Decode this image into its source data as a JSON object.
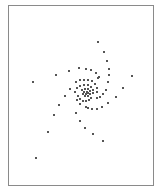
{
  "chart_data": {
    "type": "scatter",
    "title": "",
    "xlabel": "",
    "ylabel": "",
    "grid": false,
    "legend": null,
    "frame": {
      "x": 8,
      "y": 5,
      "width": 145,
      "height": 180,
      "color": "#8a8a8a"
    },
    "marker_color": "#555555",
    "points_px": [
      [
        98,
        42
      ],
      [
        104,
        52
      ],
      [
        107,
        61
      ],
      [
        109,
        69
      ],
      [
        109,
        75
      ],
      [
        108,
        82
      ],
      [
        106,
        90
      ],
      [
        103,
        94
      ],
      [
        100,
        97
      ],
      [
        97,
        98
      ],
      [
        132,
        76
      ],
      [
        123,
        88
      ],
      [
        116,
        97
      ],
      [
        108,
        103
      ],
      [
        102,
        107
      ],
      [
        97,
        109
      ],
      [
        92,
        109
      ],
      [
        88,
        108
      ],
      [
        86,
        107
      ],
      [
        80,
        104
      ],
      [
        77,
        100
      ],
      [
        76,
        113
      ],
      [
        80,
        121
      ],
      [
        85,
        128
      ],
      [
        93,
        134
      ],
      [
        103,
        141
      ],
      [
        33,
        82
      ],
      [
        56,
        75
      ],
      [
        69,
        71
      ],
      [
        79,
        68
      ],
      [
        86,
        69
      ],
      [
        91,
        70
      ],
      [
        96,
        73
      ],
      [
        99,
        77
      ],
      [
        98,
        78
      ],
      [
        70,
        89
      ],
      [
        65,
        96
      ],
      [
        59,
        105
      ],
      [
        54,
        115
      ],
      [
        48,
        132
      ],
      [
        36,
        158
      ],
      [
        76,
        82
      ],
      [
        80,
        80
      ],
      [
        84,
        80
      ],
      [
        88,
        80
      ],
      [
        92,
        81
      ],
      [
        95,
        84
      ],
      [
        97,
        88
      ],
      [
        97,
        92
      ],
      [
        75,
        92
      ],
      [
        77,
        88
      ],
      [
        80,
        86
      ],
      [
        84,
        85
      ],
      [
        88,
        85
      ],
      [
        91,
        87
      ],
      [
        93,
        90
      ],
      [
        93,
        93
      ],
      [
        78,
        96
      ],
      [
        80,
        99
      ],
      [
        83,
        101
      ],
      [
        86,
        101
      ],
      [
        89,
        100
      ],
      [
        91,
        98
      ],
      [
        82,
        90
      ],
      [
        85,
        89
      ],
      [
        88,
        89
      ],
      [
        90,
        91
      ],
      [
        90,
        94
      ],
      [
        88,
        96
      ],
      [
        85,
        96
      ],
      [
        83,
        94
      ],
      [
        84,
        92
      ],
      [
        87,
        92
      ],
      [
        88,
        93
      ],
      [
        86,
        94
      ]
    ]
  }
}
